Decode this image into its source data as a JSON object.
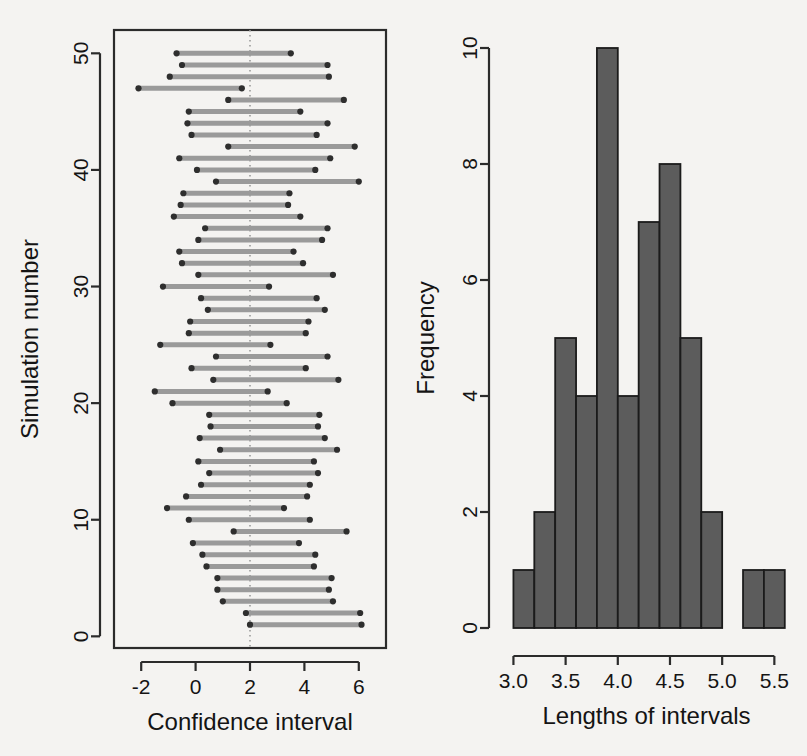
{
  "figure": {
    "background_color": "#f4f3f1",
    "panels": 2
  },
  "chart_data": [
    {
      "type": "scatter",
      "subtype": "confidence-interval-plot",
      "title": "",
      "xlabel": "Confidence interval",
      "ylabel": "Simulation number",
      "xlim": [
        -3.0,
        7.0
      ],
      "ylim": [
        -1,
        52
      ],
      "xticks": [
        -2,
        0,
        2,
        4,
        6
      ],
      "xticklabels": [
        "-2",
        "0",
        "2",
        "4",
        "6"
      ],
      "yticks": [
        0,
        10,
        20,
        30,
        40,
        50
      ],
      "yticklabels": [
        "0",
        "10",
        "20",
        "30",
        "40",
        "50"
      ],
      "grid": false,
      "legend": null,
      "box": true,
      "annotations": [
        {
          "type": "vertical-reference-line",
          "x": 2,
          "style": "dotted",
          "color": "#9b9b9b",
          "label": "true mean"
        }
      ],
      "series_style": {
        "line_color": "#9a9a9a",
        "endpoint_color": "#2e2e2e",
        "line_width": 5
      },
      "intervals": [
        {
          "simulation": 1,
          "lower": 2.0,
          "upper": 6.1,
          "length": 4.1,
          "covers": true
        },
        {
          "simulation": 2,
          "lower": 1.85,
          "upper": 6.05,
          "length": 4.2,
          "covers": true
        },
        {
          "simulation": 3,
          "lower": 1.0,
          "upper": 5.05,
          "length": 4.05,
          "covers": true
        },
        {
          "simulation": 4,
          "lower": 0.8,
          "upper": 4.9,
          "length": 4.1,
          "covers": true
        },
        {
          "simulation": 5,
          "lower": 0.8,
          "upper": 5.0,
          "length": 4.2,
          "covers": true
        },
        {
          "simulation": 6,
          "lower": 0.4,
          "upper": 4.35,
          "length": 3.95,
          "covers": true
        },
        {
          "simulation": 7,
          "lower": 0.25,
          "upper": 4.4,
          "length": 4.15,
          "covers": true
        },
        {
          "simulation": 8,
          "lower": -0.1,
          "upper": 3.8,
          "length": 3.9,
          "covers": true
        },
        {
          "simulation": 9,
          "lower": 1.4,
          "upper": 5.55,
          "length": 4.15,
          "covers": true
        },
        {
          "simulation": 10,
          "lower": -0.25,
          "upper": 4.2,
          "length": 4.45,
          "covers": true
        },
        {
          "simulation": 11,
          "lower": -1.05,
          "upper": 3.25,
          "length": 4.3,
          "covers": true
        },
        {
          "simulation": 12,
          "lower": -0.35,
          "upper": 4.1,
          "length": 4.45,
          "covers": true
        },
        {
          "simulation": 13,
          "lower": 0.2,
          "upper": 4.2,
          "length": 4.0,
          "covers": true
        },
        {
          "simulation": 14,
          "lower": 0.5,
          "upper": 4.5,
          "length": 4.0,
          "covers": true
        },
        {
          "simulation": 15,
          "lower": 0.1,
          "upper": 4.35,
          "length": 4.25,
          "covers": true
        },
        {
          "simulation": 16,
          "lower": 0.9,
          "upper": 5.2,
          "length": 4.3,
          "covers": true
        },
        {
          "simulation": 17,
          "lower": 0.15,
          "upper": 4.75,
          "length": 4.6,
          "covers": true
        },
        {
          "simulation": 18,
          "lower": 0.55,
          "upper": 4.5,
          "length": 3.95,
          "covers": true
        },
        {
          "simulation": 19,
          "lower": 0.5,
          "upper": 4.55,
          "length": 4.05,
          "covers": true
        },
        {
          "simulation": 20,
          "lower": -0.85,
          "upper": 3.35,
          "length": 4.2,
          "covers": true
        },
        {
          "simulation": 21,
          "lower": -1.5,
          "upper": 2.65,
          "length": 4.15,
          "covers": true
        },
        {
          "simulation": 22,
          "lower": 0.65,
          "upper": 5.25,
          "length": 4.6,
          "covers": true
        },
        {
          "simulation": 23,
          "lower": -0.15,
          "upper": 4.05,
          "length": 4.2,
          "covers": true
        },
        {
          "simulation": 24,
          "lower": 0.75,
          "upper": 4.85,
          "length": 4.1,
          "covers": true
        },
        {
          "simulation": 25,
          "lower": -1.3,
          "upper": 2.75,
          "length": 4.05,
          "covers": true
        },
        {
          "simulation": 26,
          "lower": -0.25,
          "upper": 4.05,
          "length": 4.3,
          "covers": true
        },
        {
          "simulation": 27,
          "lower": -0.2,
          "upper": 4.15,
          "length": 4.35,
          "covers": true
        },
        {
          "simulation": 28,
          "lower": 0.45,
          "upper": 4.75,
          "length": 4.3,
          "covers": true
        },
        {
          "simulation": 29,
          "lower": 0.2,
          "upper": 4.45,
          "length": 4.25,
          "covers": true
        },
        {
          "simulation": 30,
          "lower": -1.2,
          "upper": 2.7,
          "length": 3.9,
          "covers": true
        },
        {
          "simulation": 31,
          "lower": 0.1,
          "upper": 5.05,
          "length": 4.95,
          "covers": true
        },
        {
          "simulation": 32,
          "lower": -0.5,
          "upper": 3.95,
          "length": 4.45,
          "covers": true
        },
        {
          "simulation": 33,
          "lower": -0.6,
          "upper": 3.6,
          "length": 4.2,
          "covers": true
        },
        {
          "simulation": 34,
          "lower": 0.1,
          "upper": 4.65,
          "length": 4.55,
          "covers": true
        },
        {
          "simulation": 35,
          "lower": 0.35,
          "upper": 4.85,
          "length": 4.5,
          "covers": true
        },
        {
          "simulation": 36,
          "lower": -0.8,
          "upper": 3.85,
          "length": 4.65,
          "covers": true
        },
        {
          "simulation": 37,
          "lower": -0.55,
          "upper": 3.4,
          "length": 3.95,
          "covers": true
        },
        {
          "simulation": 38,
          "lower": -0.45,
          "upper": 3.45,
          "length": 3.9,
          "covers": true
        },
        {
          "simulation": 39,
          "lower": 0.75,
          "upper": 6.0,
          "length": 5.25,
          "covers": true
        },
        {
          "simulation": 40,
          "lower": 0.05,
          "upper": 4.4,
          "length": 4.35,
          "covers": true
        },
        {
          "simulation": 41,
          "lower": -0.6,
          "upper": 4.95,
          "length": 5.55,
          "covers": true
        },
        {
          "simulation": 42,
          "lower": 1.2,
          "upper": 5.85,
          "length": 4.65,
          "covers": true
        },
        {
          "simulation": 43,
          "lower": -0.15,
          "upper": 4.45,
          "length": 4.6,
          "covers": true
        },
        {
          "simulation": 44,
          "lower": -0.3,
          "upper": 4.85,
          "length": 5.15,
          "covers": true
        },
        {
          "simulation": 45,
          "lower": -0.25,
          "upper": 3.85,
          "length": 4.1,
          "covers": true
        },
        {
          "simulation": 46,
          "lower": 1.2,
          "upper": 5.45,
          "length": 4.25,
          "covers": true
        },
        {
          "simulation": 47,
          "lower": -2.1,
          "upper": 1.7,
          "length": 3.8,
          "covers": false
        },
        {
          "simulation": 48,
          "lower": -0.95,
          "upper": 4.9,
          "length": 5.85,
          "covers": true
        },
        {
          "simulation": 49,
          "lower": -0.5,
          "upper": 4.85,
          "length": 5.35,
          "covers": true
        },
        {
          "simulation": 50,
          "lower": -0.7,
          "upper": 3.5,
          "length": 4.2,
          "covers": true
        }
      ]
    },
    {
      "type": "bar",
      "subtype": "histogram",
      "title": "",
      "xlabel": "Lengths of intervals",
      "ylabel": "Frequency",
      "xlim": [
        2.9,
        5.65
      ],
      "ylim": [
        0,
        10
      ],
      "xticks": [
        3.0,
        3.5,
        4.0,
        4.5,
        5.0,
        5.5
      ],
      "xticklabels": [
        "3.0",
        "3.5",
        "4.0",
        "4.5",
        "5.0",
        "5.5"
      ],
      "yticks": [
        0,
        2,
        4,
        6,
        8,
        10
      ],
      "yticklabels": [
        "0",
        "2",
        "4",
        "6",
        "8",
        "10"
      ],
      "grid": false,
      "legend": null,
      "bin_width": 0.2,
      "bin_edges": [
        3.0,
        3.2,
        3.4,
        3.6,
        3.8,
        4.0,
        4.2,
        4.4,
        4.6,
        4.8,
        5.0,
        5.2,
        5.4,
        5.6
      ],
      "categories": [
        "3.0-3.2",
        "3.2-3.4",
        "3.4-3.6",
        "3.6-3.8",
        "3.8-4.0",
        "4.0-4.2",
        "4.2-4.4",
        "4.4-4.6",
        "4.6-4.8",
        "4.8-5.0",
        "5.0-5.2",
        "5.2-5.4",
        "5.4-5.6"
      ],
      "values": [
        1,
        2,
        5,
        4,
        10,
        4,
        7,
        8,
        5,
        2,
        0,
        1,
        1
      ],
      "total": 50,
      "bar_fill": "#5c5c5c",
      "bar_stroke": "#1b1b1b"
    }
  ]
}
